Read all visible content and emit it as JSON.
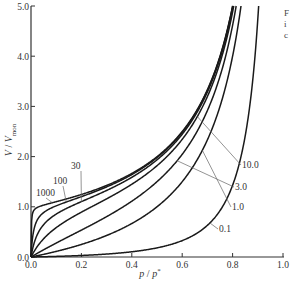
{
  "chart_data": {
    "type": "line",
    "title": "",
    "xlabel": "p / p*",
    "ylabel": "V / V_mon",
    "xlim": [
      0.0,
      1.0
    ],
    "ylim": [
      0.0,
      5.0
    ],
    "grid": false,
    "x_ticks": [
      "0.0",
      "0.2",
      "0.4",
      "0.6",
      "0.8",
      "1.0"
    ],
    "y_ticks": [
      "0.0",
      "1.0",
      "2.0",
      "3.0",
      "4.0",
      "5.0"
    ],
    "model": "BET isotherm: V/Vmon = c*x / ((1-x)*(1 - x + c*x))",
    "series": [
      {
        "name": "1000",
        "c": 1000,
        "label_pos": "upper-left"
      },
      {
        "name": "100",
        "c": 100,
        "label_pos": "upper-left"
      },
      {
        "name": "30",
        "c": 30,
        "label_pos": "upper-left"
      },
      {
        "name": "10.0",
        "c": 10,
        "label_pos": "right"
      },
      {
        "name": "3.0",
        "c": 3,
        "label_pos": "right"
      },
      {
        "name": "1.0",
        "c": 1,
        "label_pos": "right"
      },
      {
        "name": "0.1",
        "c": 0.1,
        "label_pos": "right"
      }
    ],
    "sample_points": {
      "x": [
        0.1,
        0.2,
        0.4,
        0.6,
        0.8
      ],
      "c_1000": [
        1.11,
        1.25,
        1.67,
        2.5,
        5.0
      ],
      "c_100": [
        1.1,
        1.24,
        1.66,
        2.49,
        4.98
      ],
      "c_30": [
        1.07,
        1.22,
        1.64,
        2.46,
        4.9
      ],
      "c_10.0": [
        0.58,
        0.83,
        1.23,
        2.08,
        4.44
      ],
      "c_3.0": [
        0.33,
        0.58,
        0.99,
        1.59,
        3.08
      ],
      "c_1.0": [
        0.11,
        0.25,
        0.67,
        1.5,
        4.0
      ],
      "c_0.1": [
        0.01,
        0.03,
        0.1,
        0.33,
        1.43
      ]
    },
    "legend": "inline labels with leader lines"
  },
  "axes": {
    "x_label_main": "p",
    "x_label_sep": " / ",
    "x_label_end": "p",
    "x_label_sup": "*",
    "y_label_main": "V",
    "y_label_sep": " / ",
    "y_label_end": "V",
    "y_label_sub": "mon"
  },
  "side_text": [
    "F",
    "i",
    "c"
  ]
}
